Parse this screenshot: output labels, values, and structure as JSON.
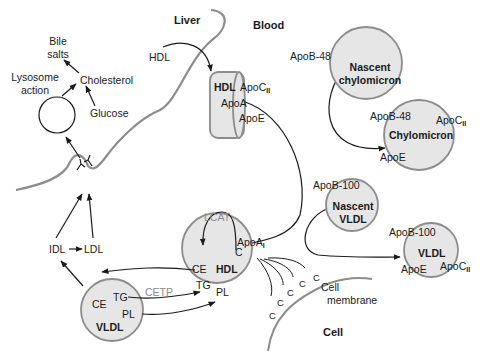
{
  "regions": {
    "liver": "Liver",
    "blood": "Blood",
    "cell": "Cell",
    "cell_membrane_line1": "Cell",
    "cell_membrane_line2": "membrane"
  },
  "liver_side": {
    "bile_line1": "Bile",
    "bile_line2": "salts",
    "lysosome_line1": "Lysosome",
    "lysosome_line2": "action",
    "cholesterol": "Cholesterol",
    "glucose": "Glucose",
    "hdl_input": "HDL",
    "idl": "IDL",
    "ldl": "LDL"
  },
  "hdl_disc": {
    "name": "HDL",
    "apo_c": "ApoC",
    "apo_c_sub": "II",
    "apo_a": "ApoA",
    "apo_e": "ApoE"
  },
  "nascent_chylomicron": {
    "apo": "ApoB-48",
    "line1": "Nascent",
    "line2": "chylomicron"
  },
  "chylomicron": {
    "apo_b": "ApoB-48",
    "apo_c": "ApoC",
    "apo_c_sub": "II",
    "name": "Chylomicron",
    "apo_e": "ApoE"
  },
  "nascent_vldl": {
    "apo": "ApoB-100",
    "line1": "Nascent",
    "line2": "VLDL"
  },
  "vldl_right": {
    "apo_b": "ApoB-100",
    "name": "VLDL",
    "apo_e": "ApoE",
    "apo_c": "ApoC",
    "apo_c_sub": "II"
  },
  "hdl_sphere": {
    "name": "HDL",
    "lcat": "LCAT",
    "apo_a": "ApoA",
    "apo_a_sub": "I",
    "c": "C",
    "ce": "CE",
    "tg": "TG",
    "pl": "PL"
  },
  "vldl_left": {
    "name": "VLDL",
    "ce": "CE",
    "tg": "TG",
    "pl": "PL",
    "cetp": "CETP"
  },
  "cholesterol_chain": [
    "C",
    "C",
    "C",
    "C",
    "C"
  ],
  "colors": {
    "particle_fill": "#e6e6e6",
    "particle_stroke": "#8c8c8c",
    "membrane": "#8c8c8c",
    "arrow": "#1a1a1a",
    "muted_text": "#8a8a8a"
  }
}
